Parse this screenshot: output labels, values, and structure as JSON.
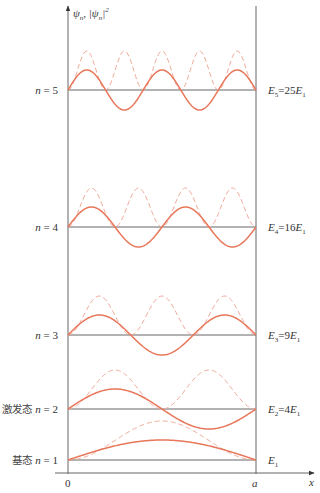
{
  "axes": {
    "y_label_main": "ψ",
    "y_label_sub": "n",
    "y_label_sep": ", |ψ",
    "y_label_sub2": "n",
    "y_label_end": "|",
    "y_label_sup": "2",
    "x_label": "x",
    "x_origin": "0",
    "x_end": "a"
  },
  "colors": {
    "wavefunction": "#e8775a",
    "probability": "#f0a898",
    "axis": "#666666"
  },
  "levels": [
    {
      "n": 1,
      "left_prefix": "基态",
      "left_label": "n = 1",
      "energy_main": "E",
      "energy_sub": "1",
      "energy_rest": "",
      "energy_sub2": ""
    },
    {
      "n": 2,
      "left_prefix": "激发态",
      "left_label": "n = 2",
      "energy_main": "E",
      "energy_sub": "2",
      "energy_rest": "=4E",
      "energy_sub2": "1"
    },
    {
      "n": 3,
      "left_prefix": "",
      "left_label": "n = 3",
      "energy_main": "E",
      "energy_sub": "3",
      "energy_rest": "=9E",
      "energy_sub2": "1"
    },
    {
      "n": 4,
      "left_prefix": "",
      "left_label": "n = 4",
      "energy_main": "E",
      "energy_sub": "4",
      "energy_rest": "=16E",
      "energy_sub2": "1"
    },
    {
      "n": 5,
      "left_prefix": "",
      "left_label": "n = 5",
      "energy_main": "E",
      "energy_sub": "5",
      "energy_rest": "=25E",
      "energy_sub2": "1"
    }
  ],
  "legend": {
    "solid": "ψn (wavefunction)",
    "dashed": "|ψn|² (probability density)"
  }
}
